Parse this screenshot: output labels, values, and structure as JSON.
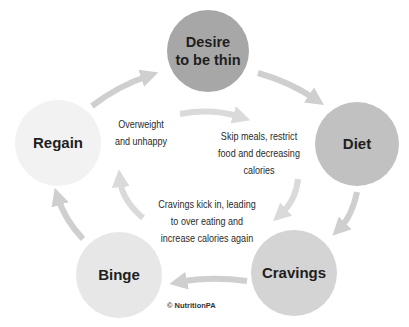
{
  "diagram": {
    "type": "cycle",
    "colors": {
      "desire_node": "#a7a7a7",
      "diet_node": "#c1c1c1",
      "cravings_node": "#d4d4d4",
      "binge_node": "#e7e7e7",
      "regain_node": "#f2f2f2",
      "arrow": "#cfcfcf",
      "inner_arrow": "#dadada",
      "text": "#1e1e1e"
    },
    "nodes": [
      {
        "id": "desire",
        "label_line1": "Desire",
        "label_line2": "to be thin"
      },
      {
        "id": "diet",
        "label": "Diet"
      },
      {
        "id": "cravings",
        "label": "Cravings"
      },
      {
        "id": "binge",
        "label": "Binge"
      },
      {
        "id": "regain",
        "label": "Regain"
      }
    ],
    "edges": [
      {
        "from": "desire",
        "to": "diet"
      },
      {
        "from": "diet",
        "to": "cravings"
      },
      {
        "from": "cravings",
        "to": "binge"
      },
      {
        "from": "binge",
        "to": "regain"
      },
      {
        "from": "regain",
        "to": "desire"
      }
    ],
    "inner_notes": [
      {
        "id": "overweight",
        "lines": [
          "Overweight",
          "and unhappy"
        ]
      },
      {
        "id": "skip-meals",
        "lines": [
          "Skip meals, restrict",
          "food and decreasing",
          "calories"
        ]
      },
      {
        "id": "cravings-kick",
        "lines": [
          "Cravings kick in, leading",
          "to over eating and",
          "increase calories again"
        ]
      }
    ],
    "copyright": "© NutritionPA"
  }
}
